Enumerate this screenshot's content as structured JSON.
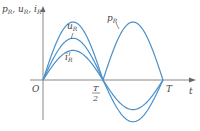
{
  "diagram": {
    "title": "",
    "y_axis_label": "p_R, u_R, i_R",
    "x_axis_label": "t",
    "origin_label": "O",
    "tick_labels": [
      "T/2",
      "T"
    ],
    "colors": {
      "curve": "#4a90c8",
      "axis": "#888888",
      "text": "#444444"
    },
    "curves": [
      {
        "name": "p_R",
        "label": "p_R",
        "amplitude": 1.0,
        "kind": "sin-squared"
      },
      {
        "name": "u_R",
        "label": "u_R",
        "amplitude": 0.72,
        "kind": "sine"
      },
      {
        "name": "i_R",
        "label": "i_R",
        "amplitude": 0.51,
        "kind": "sine"
      }
    ]
  }
}
